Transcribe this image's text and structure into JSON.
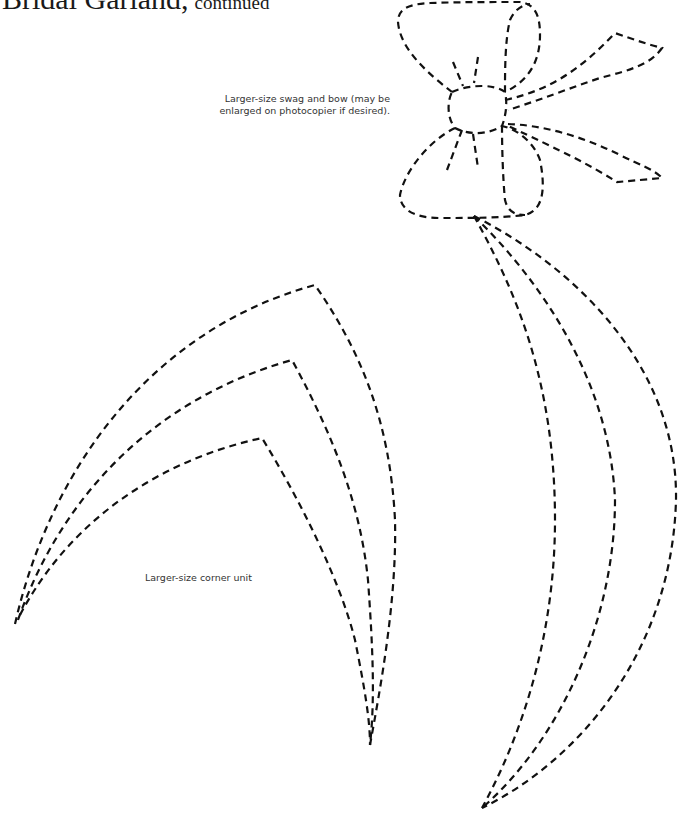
{
  "page": {
    "title": "Bridal Garland,",
    "title_suffix": "continued"
  },
  "captions": {
    "bow_line1": "Larger-size swag and bow (may be",
    "bow_line2": "enlarged on photocopier if desired).",
    "corner": "Larger-size corner unit"
  },
  "patterns": [
    {
      "name": "swag-and-bow",
      "style": "dashed-outline"
    },
    {
      "name": "corner-unit",
      "style": "dashed-outline"
    }
  ],
  "colors": {
    "ink": "#111111",
    "background": "#ffffff"
  }
}
